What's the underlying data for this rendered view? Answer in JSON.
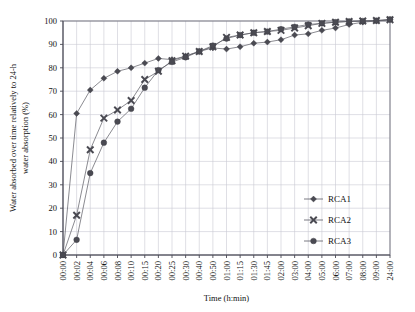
{
  "chart_data": {
    "type": "line",
    "title": "",
    "xlabel": "Time (h:min)",
    "ylabel": "Water absorbed over time relatively to 24-h water absorption (%)",
    "ylabel_line1": "Water absorbed over time relatively to 24-h",
    "ylabel_line2": "water absorption (%)",
    "ylim": [
      0,
      100
    ],
    "yticks": [
      0,
      10,
      20,
      30,
      40,
      50,
      60,
      70,
      80,
      90,
      100
    ],
    "grid": true,
    "legend_position": "center-right",
    "categories": [
      "00:00",
      "00:02",
      "00:04",
      "00:06",
      "00:08",
      "00:10",
      "00:15",
      "00:20",
      "00:25",
      "00:30",
      "00:40",
      "00:50",
      "01:00",
      "01:15",
      "01:30",
      "01:45",
      "02:00",
      "03:00",
      "04:00",
      "05:00",
      "06:00",
      "07:00",
      "08:00",
      "09:00",
      "24:00"
    ],
    "series": [
      {
        "name": "RCA1",
        "marker": "diamond",
        "values": [
          0,
          60.5,
          70.5,
          75.5,
          78.5,
          80.0,
          82.0,
          84.0,
          83.5,
          85.0,
          87.0,
          88.5,
          88.0,
          89.0,
          90.5,
          91.0,
          92.0,
          94.0,
          94.5,
          96.0,
          97.0,
          98.5,
          99.5,
          100.0,
          100.5
        ]
      },
      {
        "name": "RCA2",
        "marker": "cross",
        "values": [
          0,
          17.0,
          45.0,
          58.5,
          62.0,
          66.0,
          75.0,
          78.5,
          83.0,
          85.0,
          87.0,
          89.0,
          93.0,
          94.0,
          95.0,
          95.5,
          96.0,
          97.0,
          98.0,
          99.0,
          99.5,
          99.8,
          100.0,
          100.2,
          100.5
        ]
      },
      {
        "name": "RCA3",
        "marker": "circle",
        "values": [
          0,
          6.5,
          35.0,
          48.0,
          57.0,
          62.5,
          71.5,
          79.0,
          82.5,
          84.5,
          87.0,
          89.5,
          92.5,
          94.0,
          95.0,
          95.5,
          96.5,
          97.5,
          98.5,
          99.0,
          99.5,
          99.8,
          100.0,
          100.2,
          100.7
        ]
      }
    ],
    "legend": [
      {
        "label": "RCA1",
        "marker": "diamond"
      },
      {
        "label": "RCA2",
        "marker": "cross"
      },
      {
        "label": "RCA3",
        "marker": "circle"
      }
    ],
    "colors": {
      "series": "#4a4a52",
      "line": "#595962",
      "grid": "#c9c9d4",
      "axis": "#4a4a55",
      "text": "#111111",
      "background": "#ffffff"
    }
  }
}
